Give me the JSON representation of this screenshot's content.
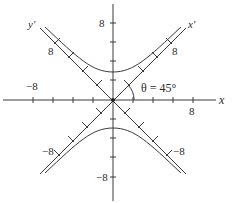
{
  "diagram": {
    "type": "rotated-hyperbola",
    "equation_hint": "hyperbola with rotated axes x' and y' at 45 degrees",
    "angle_label": "θ = 45°",
    "axes": {
      "x_label": "x",
      "y_label": "",
      "x_prime_label": "x′",
      "y_prime_label": "y′",
      "x_ticks": [
        "−8",
        "8"
      ],
      "y_ticks": [
        "8",
        "−8"
      ],
      "x_prime_ticks": [
        "8",
        "−8"
      ],
      "y_prime_ticks": [
        "8",
        "−8"
      ]
    },
    "labels": {
      "x_neg8": "−8",
      "x_pos8": "8",
      "y_pos8": "8",
      "y_neg8": "−8",
      "xp_pos8": "8",
      "xp_neg8": "−8",
      "yp_pos8": "8",
      "yp_neg8": "−8"
    },
    "colors": {
      "stroke": "#3a3a3a",
      "background": "#ffffff"
    }
  }
}
